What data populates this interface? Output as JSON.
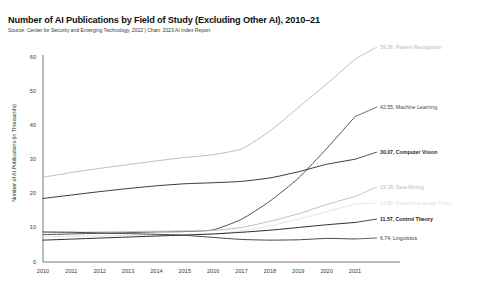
{
  "chart_data": {
    "type": "line",
    "title": "Number of AI Publications by Field of Study (Excluding Other AI), 2010–21",
    "subtitle": "Source: Center for Security and Emerging Technology, 2022 | Chart: 2023 AI Index Report",
    "xlabel": "",
    "ylabel": "Number of AI Publications (in Thousands)",
    "x": [
      2010,
      2011,
      2012,
      2013,
      2014,
      2015,
      2016,
      2017,
      2018,
      2019,
      2020,
      2021
    ],
    "xticks": [
      "2010",
      "2011",
      "2012",
      "2013",
      "2014",
      "2015",
      "2016",
      "2017",
      "2018",
      "2019",
      "2020",
      "2021"
    ],
    "yticks": [
      "0",
      "10",
      "20",
      "30",
      "40",
      "50",
      "60"
    ],
    "ylim": [
      0,
      60
    ],
    "xlim": [
      2010,
      2021
    ],
    "grid": false,
    "legend_position": "right-inline-end-labels",
    "series": [
      {
        "name": "Pattern Recognition",
        "end_value": 59.36,
        "end_label": "59.36, Pattern Recognition",
        "color": "#b9b9b9",
        "values": [
          24.8,
          26.2,
          27.4,
          28.5,
          29.6,
          30.6,
          31.4,
          33.1,
          38.3,
          45.2,
          52.1,
          59.36
        ]
      },
      {
        "name": "Machine Learning",
        "end_value": 42.55,
        "end_label": "42.55, Machine Learning",
        "color": "#4a4a4a",
        "values": [
          8.0,
          8.2,
          8.4,
          8.6,
          8.8,
          8.9,
          9.4,
          12.5,
          17.8,
          24.5,
          33.2,
          42.55
        ]
      },
      {
        "name": "Computer Vision",
        "end_value": 30.07,
        "end_label": "30.07, Computer Vision",
        "color": "#2e2e2e",
        "values": [
          18.6,
          19.6,
          20.6,
          21.5,
          22.3,
          22.9,
          23.2,
          23.6,
          24.6,
          26.4,
          28.6,
          30.07
        ]
      },
      {
        "name": "Data Mining",
        "end_value": 19.18,
        "end_label": "19.18, Data Mining",
        "color": "#bdbdbd",
        "values": [
          8.6,
          8.7,
          8.8,
          8.9,
          9.0,
          9.1,
          9.2,
          10.1,
          11.9,
          14.1,
          16.8,
          19.18
        ]
      },
      {
        "name": "Natural Language Processing",
        "end_value": 16.95,
        "end_label": "16.95, Natural Language Proce",
        "color": "#e2e2e2",
        "values": [
          7.4,
          7.5,
          7.6,
          7.8,
          7.9,
          8.0,
          8.2,
          9.1,
          10.6,
          12.5,
          14.7,
          16.95
        ]
      },
      {
        "name": "Control Theory",
        "end_value": 11.57,
        "end_label": "11.57, Control Theory",
        "color": "#212121",
        "values": [
          6.4,
          6.7,
          7.0,
          7.3,
          7.6,
          7.9,
          8.2,
          8.7,
          9.3,
          10.1,
          10.9,
          11.57
        ]
      },
      {
        "name": "Linguistics",
        "end_value": 6.74,
        "end_label": "6.74, Linguistics",
        "color": "#3d3d3d",
        "values": [
          8.8,
          8.7,
          8.5,
          8.3,
          8.1,
          7.8,
          7.2,
          6.6,
          6.4,
          6.5,
          6.9,
          6.74
        ]
      }
    ]
  }
}
